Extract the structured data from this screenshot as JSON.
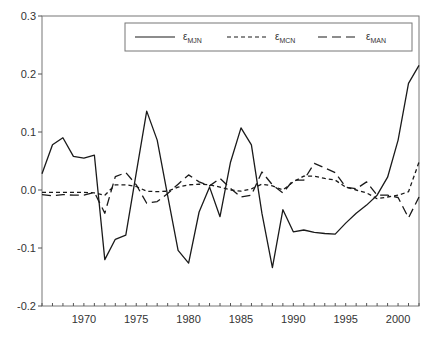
{
  "chart_data": {
    "type": "line",
    "title": "",
    "xlabel": "",
    "ylabel": "",
    "xlim": [
      1966,
      2002
    ],
    "ylim": [
      -0.2,
      0.3
    ],
    "grid": false,
    "legend_position": "top (inside box)",
    "x_ticks": [
      1970,
      1975,
      1980,
      1985,
      1990,
      1995,
      2000
    ],
    "y_ticks": [
      -0.2,
      -0.1,
      0.0,
      0.1,
      0.2,
      0.3
    ],
    "y_tick_labels": [
      "-0.2",
      "-0.1",
      "0.0",
      "0.1",
      "0.2",
      "0.3"
    ],
    "x": [
      1966,
      1967,
      1968,
      1969,
      1970,
      1971,
      1972,
      1973,
      1974,
      1975,
      1976,
      1977,
      1978,
      1979,
      1980,
      1981,
      1982,
      1983,
      1984,
      1985,
      1986,
      1987,
      1988,
      1989,
      1990,
      1991,
      1992,
      1993,
      1994,
      1995,
      1996,
      1997,
      1998,
      1999,
      2000,
      2001,
      2002
    ],
    "series": [
      {
        "name": "ε_MJN",
        "legend_main": "ε",
        "legend_sub": "MJN",
        "style": "solid",
        "values": [
          0.028,
          0.078,
          0.09,
          0.058,
          0.055,
          0.06,
          -0.12,
          -0.085,
          -0.078,
          0.03,
          0.136,
          0.086,
          -0.01,
          -0.104,
          -0.126,
          -0.038,
          0.005,
          -0.046,
          0.048,
          0.107,
          0.078,
          -0.04,
          -0.134,
          -0.034,
          -0.072,
          -0.069,
          -0.073,
          -0.075,
          -0.076,
          -0.057,
          -0.04,
          -0.026,
          -0.009,
          0.022,
          0.086,
          0.184,
          0.215
        ]
      },
      {
        "name": "ε_MCN",
        "legend_main": "ε",
        "legend_sub": "MCN",
        "style": "short-dash",
        "values": [
          -0.004,
          -0.004,
          -0.004,
          -0.004,
          -0.004,
          -0.005,
          -0.009,
          0.009,
          0.009,
          0.006,
          -0.002,
          -0.003,
          -0.002,
          0.005,
          0.009,
          0.01,
          0.009,
          0.005,
          0.0,
          -0.002,
          0.002,
          0.01,
          0.007,
          0.0,
          0.014,
          0.024,
          0.024,
          0.02,
          0.017,
          0.005,
          0.0,
          -0.005,
          -0.015,
          -0.012,
          -0.009,
          -0.003,
          0.048
        ]
      },
      {
        "name": "ε_MAN",
        "legend_main": "ε",
        "legend_sub": "MAN",
        "style": "long-dash",
        "values": [
          -0.008,
          -0.01,
          -0.008,
          -0.009,
          -0.009,
          -0.004,
          -0.04,
          0.023,
          0.03,
          0.009,
          -0.023,
          -0.02,
          -0.006,
          0.01,
          0.026,
          0.014,
          0.007,
          0.02,
          0.003,
          -0.012,
          -0.009,
          0.031,
          0.009,
          -0.005,
          0.017,
          0.017,
          0.046,
          0.038,
          0.03,
          0.005,
          0.002,
          0.014,
          -0.009,
          -0.009,
          -0.013,
          -0.048,
          -0.012
        ]
      }
    ]
  },
  "colors": {
    "line": "#1a1a1a",
    "axis": "#555555",
    "background": "#ffffff"
  }
}
